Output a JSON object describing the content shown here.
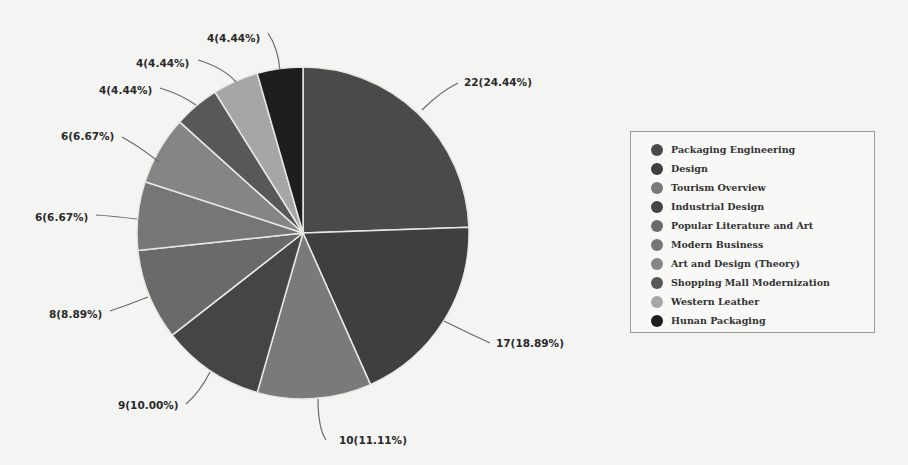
{
  "chart_data": {
    "type": "pie",
    "title": "",
    "total": 90,
    "start_angle_deg": 0,
    "direction": "clockwise",
    "center": [
      303,
      233
    ],
    "radius": 166,
    "legend_position": "right",
    "categories": [
      "Packaging Engineering",
      "Design",
      "Tourism Overview",
      "Industrial Design",
      "Popular Literature and Art",
      "Modern Business",
      "Art and Design (Theory)",
      "Shopping Mall Modernization",
      "Western Leather",
      "Hunan Packaging"
    ],
    "values": [
      22,
      17,
      10,
      9,
      8,
      6,
      6,
      4,
      4,
      4
    ],
    "percentages": [
      24.44,
      18.89,
      11.11,
      10.0,
      8.89,
      6.67,
      6.67,
      4.44,
      4.44,
      4.44
    ],
    "data_labels": [
      "22(24.44%)",
      "17(18.89%)",
      "10(11.11%)",
      "9(10.00%)",
      "8(8.89%)",
      "6(6.67%)",
      "6(6.67%)",
      "4(4.44%)",
      "4(4.44%)",
      "4(4.44%)"
    ],
    "colors": [
      "#4a4a4a",
      "#3f3f3f",
      "#7a7a7a",
      "#454545",
      "#6a6a6a",
      "#767676",
      "#858585",
      "#585858",
      "#a6a6a6",
      "#1e1e1e"
    ],
    "label_positions": [
      {
        "x": 464,
        "y": 86,
        "anchor": "start",
        "line": [
          [
            422,
            110
          ],
          [
            440,
            92
          ],
          [
            458,
            83
          ]
        ]
      },
      {
        "x": 496,
        "y": 347,
        "anchor": "start",
        "line": [
          [
            444,
            321
          ],
          [
            468,
            333
          ],
          [
            490,
            343
          ]
        ]
      },
      {
        "x": 339,
        "y": 444,
        "anchor": "start",
        "line": [
          [
            318,
            399
          ],
          [
            318,
            428
          ],
          [
            326,
            440
          ]
        ]
      },
      {
        "x": 118,
        "y": 409,
        "anchor": "start",
        "line": [
          [
            210,
            372
          ],
          [
            200,
            392
          ],
          [
            186,
            404
          ]
        ]
      },
      {
        "x": 49,
        "y": 318,
        "anchor": "start",
        "line": [
          [
            148,
            297
          ],
          [
            128,
            305
          ],
          [
            110,
            311
          ]
        ]
      },
      {
        "x": 35,
        "y": 221,
        "anchor": "start",
        "line": [
          [
            137,
            219
          ],
          [
            112,
            216
          ],
          [
            96,
            215
          ]
        ]
      },
      {
        "x": 61,
        "y": 140,
        "anchor": "start",
        "line": [
          [
            159,
            162
          ],
          [
            140,
            147
          ],
          [
            122,
            137
          ]
        ]
      },
      {
        "x": 99,
        "y": 94,
        "anchor": "start",
        "line": [
          [
            196,
            105
          ],
          [
            180,
            94
          ],
          [
            160,
            88
          ]
        ]
      },
      {
        "x": 136,
        "y": 67,
        "anchor": "start",
        "line": [
          [
            236,
            82
          ],
          [
            224,
            68
          ],
          [
            198,
            60
          ]
        ]
      },
      {
        "x": 207,
        "y": 42,
        "anchor": "start",
        "line": [
          [
            280,
            70
          ],
          [
            278,
            48
          ],
          [
            268,
            33
          ]
        ]
      }
    ]
  },
  "legend": {
    "items": [
      {
        "label": "Packaging Engineering",
        "color": "#4a4a4a"
      },
      {
        "label": "Design",
        "color": "#3f3f3f"
      },
      {
        "label": "Tourism Overview",
        "color": "#7a7a7a"
      },
      {
        "label": "Industrial Design",
        "color": "#454545"
      },
      {
        "label": "Popular Literature and Art",
        "color": "#6a6a6a"
      },
      {
        "label": "Modern Business",
        "color": "#767676"
      },
      {
        "label": "Art and Design (Theory)",
        "color": "#858585"
      },
      {
        "label": "Shopping Mall Modernization",
        "color": "#585858"
      },
      {
        "label": "Western Leather",
        "color": "#a6a6a6"
      },
      {
        "label": "Hunan Packaging",
        "color": "#1e1e1e"
      }
    ]
  }
}
